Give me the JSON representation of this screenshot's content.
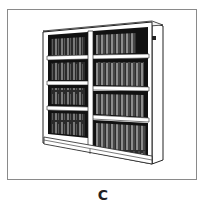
{
  "figure": {
    "columns": 2,
    "shelves_per_column": 4,
    "colors": {
      "frame_border": "#8a8a8a",
      "shelf_wood": "#ffffff",
      "interior_shadow": "#111111",
      "book_dark": "#333333",
      "book_light": "#8c8c8c"
    }
  },
  "caption": {
    "label": "C"
  }
}
